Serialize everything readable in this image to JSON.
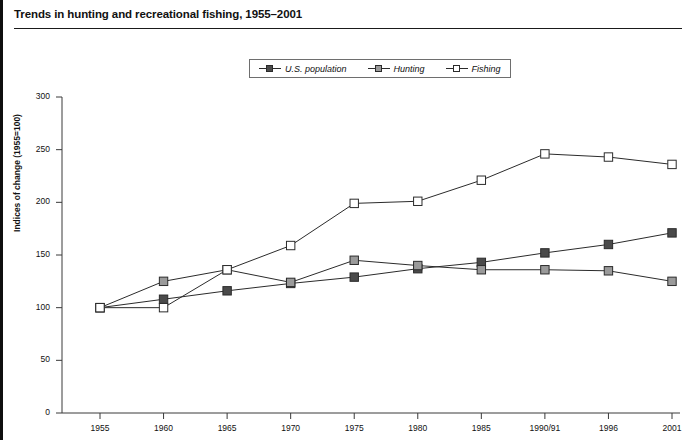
{
  "page": {
    "title": "Trends in hunting and recreational fishing, 1955–2001"
  },
  "legend": {
    "position": "top-center",
    "items": [
      {
        "label": "U.S. population",
        "marker": "filled-dark-square",
        "color": "#4a4a4a"
      },
      {
        "label": "Hunting",
        "marker": "filled-gray-square",
        "color": "#9a9a9a"
      },
      {
        "label": "Fishing",
        "marker": "open-white-square",
        "color": "#ffffff"
      }
    ]
  },
  "chart_data": {
    "type": "line",
    "title": "Trends in hunting and recreational fishing, 1955–2001",
    "xlabel": "",
    "ylabel": "Indices of change (1955=100)",
    "categories": [
      "1955",
      "1960",
      "1965",
      "1970",
      "1975",
      "1980",
      "1985",
      "1990/91",
      "1996",
      "2001"
    ],
    "yticks": [
      0,
      50,
      100,
      150,
      200,
      250,
      300
    ],
    "ylim": [
      0,
      300
    ],
    "grid": false,
    "legend_position": "top-center",
    "series": [
      {
        "name": "U.S. population",
        "color": "#4a4a4a",
        "marker": "filled-dark-square",
        "values": [
          100,
          108,
          116,
          123,
          129,
          137,
          143,
          152,
          160,
          171
        ]
      },
      {
        "name": "Hunting",
        "color": "#9a9a9a",
        "marker": "filled-gray-square",
        "values": [
          100,
          125,
          136,
          124,
          145,
          140,
          136,
          136,
          135,
          125
        ]
      },
      {
        "name": "Fishing",
        "color": "#ffffff",
        "marker": "open-white-square",
        "values": [
          100,
          100,
          136,
          159,
          199,
          201,
          221,
          246,
          243,
          236
        ]
      }
    ]
  },
  "axes": {
    "ytick_labels": [
      "300",
      "250",
      "200",
      "150",
      "100",
      "50",
      "0"
    ],
    "xtick_labels": [
      "1955",
      "1960",
      "1965",
      "1970",
      "1975",
      "1980",
      "1985",
      "1990/91",
      "1996",
      "2001"
    ]
  }
}
